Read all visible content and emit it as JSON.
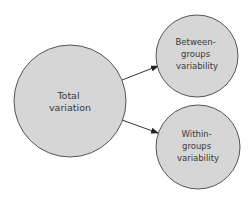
{
  "diagram": {
    "type": "flow",
    "colors": {
      "node_fill": "#d6d6d6",
      "node_stroke": "#555555",
      "arrow": "#333333",
      "text": "#3a3a3a",
      "background": "#ffffff"
    },
    "nodes": [
      {
        "id": "total",
        "lines": [
          "Total",
          "variation"
        ],
        "cx": 70,
        "cy": 101,
        "r": 56
      },
      {
        "id": "between",
        "lines": [
          "Between-",
          "groups",
          "variability"
        ],
        "cx": 197,
        "cy": 56,
        "r": 41
      },
      {
        "id": "within",
        "lines": [
          "Within-",
          "groups",
          "variability"
        ],
        "cx": 198,
        "cy": 147,
        "r": 42
      }
    ],
    "edges": [
      {
        "from": "total",
        "to": "between"
      },
      {
        "from": "total",
        "to": "within"
      }
    ]
  }
}
